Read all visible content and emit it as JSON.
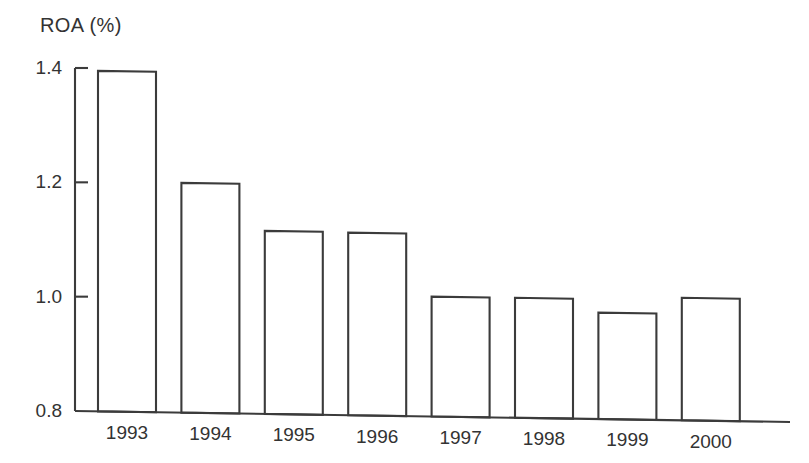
{
  "chart_data": {
    "type": "bar",
    "title": "ROA (%)",
    "xlabel": "",
    "ylabel": "ROA (%)",
    "categories": [
      "1993",
      "1994",
      "1995",
      "1996",
      "1997",
      "1998",
      "1999",
      "2000"
    ],
    "values": [
      1.395,
      1.199,
      1.115,
      1.112,
      1.0,
      0.998,
      0.972,
      0.998
    ],
    "ylim": [
      0.8,
      1.4
    ],
    "yticks": [
      0.8,
      1.0,
      1.2,
      1.4
    ],
    "ytick_labels": [
      "0.8",
      "1.0",
      "1.2",
      "1.4"
    ],
    "grid": false,
    "legend": null,
    "series": [
      {
        "name": "ROA",
        "values": [
          1.395,
          1.199,
          1.115,
          1.112,
          1.0,
          0.998,
          0.972,
          0.998
        ]
      }
    ],
    "bar_style": {
      "fill": "#ffffff",
      "stroke": "#3b3b3b"
    }
  },
  "figure": {
    "background": "#ffffff",
    "axis_color": "#3b3b3b",
    "text_color": "#333333"
  }
}
